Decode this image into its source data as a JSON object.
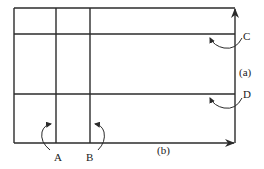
{
  "diagram": {
    "labels": {
      "a": "(a)",
      "b": "(b)",
      "A": "A",
      "B": "B",
      "C": "C",
      "D": "D"
    },
    "colors": {
      "line": "#2b2b2b",
      "background": "#ffffff"
    },
    "elements": {
      "frame": "rectangle grid",
      "horizontal_lines": [
        "C",
        "D"
      ],
      "vertical_lines": [
        "A",
        "B"
      ],
      "arrows": [
        {
          "id": "a",
          "direction": "up",
          "along": "right edge"
        },
        {
          "id": "b",
          "direction": "right",
          "along": "bottom edge"
        }
      ],
      "curved_arrows": [
        {
          "label": "A",
          "points_to": "vertical line A"
        },
        {
          "label": "B",
          "points_to": "vertical line B"
        },
        {
          "label": "C",
          "points_to": "horizontal line C"
        },
        {
          "label": "D",
          "points_to": "horizontal line D"
        }
      ]
    }
  }
}
